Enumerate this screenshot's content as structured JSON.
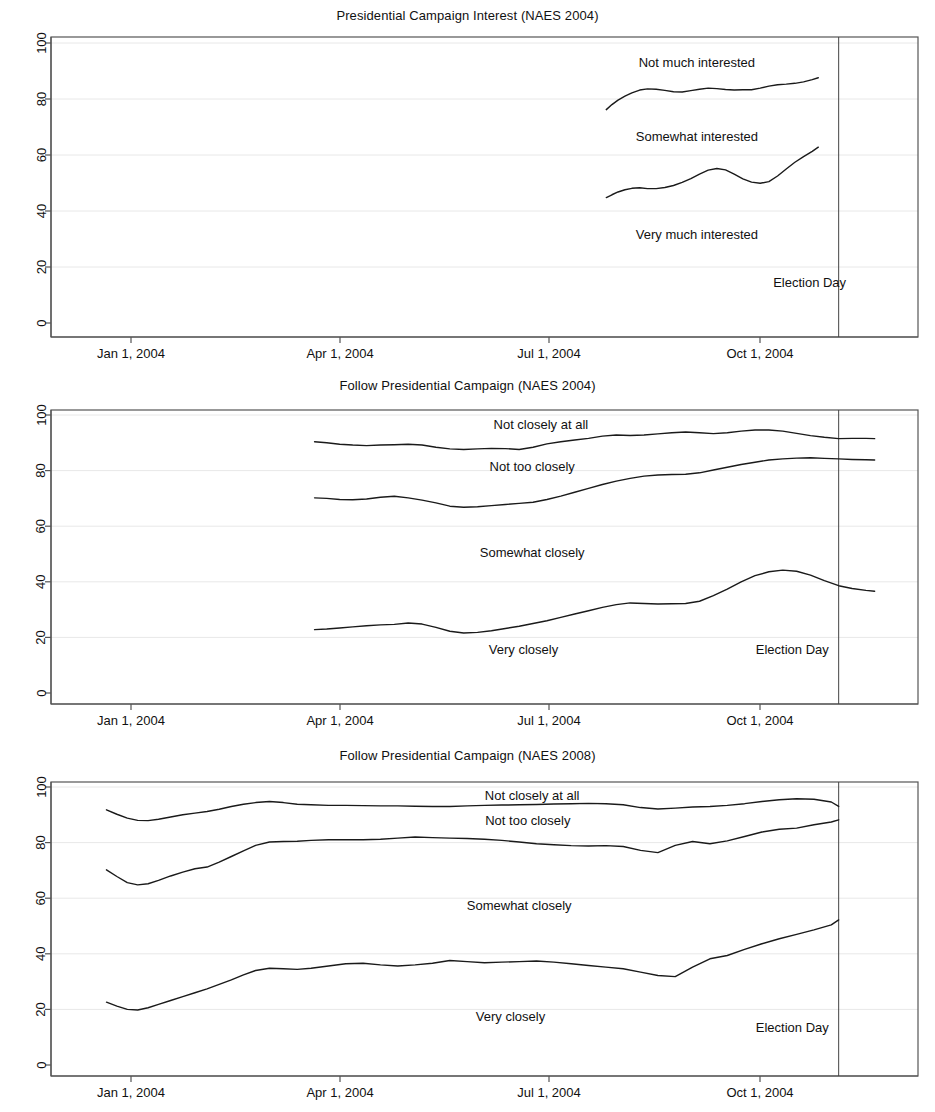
{
  "figure": {
    "background_color": "#ffffff",
    "line_color": "#1a1a1a",
    "grid_color": "#e8e8e8",
    "axis_color": "#555555"
  },
  "chart_data": [
    {
      "type": "line",
      "title": "Presidential Campaign Interest (NAES 2004)",
      "xlabel": "",
      "ylabel": "",
      "ylim": [
        0,
        100
      ],
      "yticks": [
        0,
        20,
        40,
        60,
        80,
        100
      ],
      "xlim": [
        "2003-11-20",
        "2004-11-20"
      ],
      "xticks": [
        "Jan 1, 2004",
        "Apr 1, 2004",
        "Jul 1, 2004",
        "Oct 1, 2004"
      ],
      "xtick_dates": [
        "2004-01-01",
        "2004-04-01",
        "2004-07-01",
        "2004-10-01"
      ],
      "grid": true,
      "legend_position": "inline-annotations",
      "annotations": [
        {
          "text": "Not much interested",
          "x_frac": 0.745,
          "y_value": 93
        },
        {
          "text": "Somewhat interested",
          "x_frac": 0.745,
          "y_value": 66.5
        },
        {
          "text": "Very much interested",
          "x_frac": 0.745,
          "y_value": 31.5
        },
        {
          "text": "Election Day",
          "x_frac": 0.875,
          "y_value": 14.5
        }
      ],
      "reference_line": {
        "label": "Election Day",
        "x_frac": 0.9085
      },
      "series": [
        {
          "name": "Cumulative: Not much interested (upper band)",
          "x_frac": [
            0.6405,
            0.647,
            0.654,
            0.662,
            0.67,
            0.679,
            0.688,
            0.698,
            0.708,
            0.718,
            0.728,
            0.738,
            0.748,
            0.758,
            0.768,
            0.778,
            0.788,
            0.798,
            0.808,
            0.818,
            0.828,
            0.838,
            0.848,
            0.858,
            0.868,
            0.878,
            0.885
          ],
          "values": [
            76.2,
            78.0,
            79.6,
            81.0,
            82.2,
            83.2,
            83.6,
            83.5,
            83.1,
            82.6,
            82.5,
            83.0,
            83.5,
            83.9,
            83.7,
            83.4,
            83.2,
            83.3,
            83.3,
            83.9,
            84.6,
            85.1,
            85.3,
            85.6,
            86.1,
            86.9,
            87.6
          ]
        },
        {
          "name": "Cumulative: Somewhat + Very interested (lower band)",
          "x_frac": [
            0.6405,
            0.647,
            0.654,
            0.662,
            0.67,
            0.679,
            0.688,
            0.698,
            0.708,
            0.718,
            0.728,
            0.738,
            0.748,
            0.758,
            0.768,
            0.778,
            0.788,
            0.798,
            0.808,
            0.818,
            0.828,
            0.838,
            0.848,
            0.858,
            0.868,
            0.878,
            0.885
          ],
          "values": [
            44.8,
            45.8,
            46.8,
            47.6,
            48.1,
            48.3,
            48.0,
            48.0,
            48.4,
            49.1,
            50.2,
            51.6,
            53.2,
            54.6,
            55.2,
            54.7,
            53.2,
            51.5,
            50.3,
            49.9,
            50.5,
            52.5,
            55.0,
            57.4,
            59.4,
            61.3,
            62.8
          ]
        }
      ]
    },
    {
      "type": "line",
      "title": "Follow Presidential Campaign (NAES 2004)",
      "xlabel": "",
      "ylabel": "",
      "ylim": [
        0,
        100
      ],
      "yticks": [
        0,
        20,
        40,
        60,
        80,
        100
      ],
      "xlim": [
        "2003-11-20",
        "2004-11-20"
      ],
      "xticks": [
        "Jan 1, 2004",
        "Apr 1, 2004",
        "Jul 1, 2004",
        "Oct 1, 2004"
      ],
      "xtick_dates": [
        "2004-01-01",
        "2004-04-01",
        "2004-07-01",
        "2004-10-01"
      ],
      "grid": true,
      "legend_position": "inline-annotations",
      "annotations": [
        {
          "text": "Not closely at all",
          "x_frac": 0.565,
          "y_value": 96.5
        },
        {
          "text": "Not too closely",
          "x_frac": 0.555,
          "y_value": 81.5
        },
        {
          "text": "Somewhat closely",
          "x_frac": 0.555,
          "y_value": 50.5
        },
        {
          "text": "Very closely",
          "x_frac": 0.545,
          "y_value": 15.5
        },
        {
          "text": "Election Day",
          "x_frac": 0.855,
          "y_value": 15.5
        }
      ],
      "reference_line": {
        "label": "Election Day",
        "x_frac": 0.9085
      },
      "series": [
        {
          "name": "Cumulative: Not closely at all (top band)",
          "x_frac": [
            0.304,
            0.318,
            0.333,
            0.348,
            0.364,
            0.38,
            0.396,
            0.412,
            0.428,
            0.444,
            0.46,
            0.476,
            0.492,
            0.508,
            0.524,
            0.54,
            0.556,
            0.572,
            0.588,
            0.604,
            0.62,
            0.636,
            0.652,
            0.668,
            0.684,
            0.7,
            0.716,
            0.732,
            0.748,
            0.764,
            0.78,
            0.796,
            0.812,
            0.828,
            0.844,
            0.86,
            0.876,
            0.892,
            0.9085,
            0.924,
            0.94,
            0.95
          ],
          "values": [
            90.4,
            90.0,
            89.5,
            89.2,
            89.0,
            89.2,
            89.3,
            89.5,
            89.2,
            88.4,
            87.8,
            87.6,
            87.8,
            88.0,
            87.9,
            87.6,
            88.4,
            89.6,
            90.4,
            91.0,
            91.6,
            92.4,
            92.8,
            92.6,
            92.8,
            93.2,
            93.6,
            93.9,
            93.6,
            93.3,
            93.6,
            94.2,
            94.6,
            94.6,
            94.2,
            93.4,
            92.6,
            92.0,
            91.5,
            91.6,
            91.6,
            91.5
          ]
        },
        {
          "name": "Cumulative: Not too closely (middle band)",
          "x_frac": [
            0.304,
            0.318,
            0.333,
            0.348,
            0.364,
            0.38,
            0.396,
            0.412,
            0.428,
            0.444,
            0.46,
            0.476,
            0.492,
            0.508,
            0.524,
            0.54,
            0.556,
            0.572,
            0.588,
            0.604,
            0.62,
            0.636,
            0.652,
            0.668,
            0.684,
            0.7,
            0.716,
            0.732,
            0.748,
            0.764,
            0.78,
            0.796,
            0.812,
            0.828,
            0.844,
            0.86,
            0.876,
            0.892,
            0.9085,
            0.924,
            0.94,
            0.95
          ],
          "values": [
            70.2,
            70.0,
            69.6,
            69.5,
            69.8,
            70.4,
            70.8,
            70.2,
            69.4,
            68.4,
            67.2,
            66.8,
            67.0,
            67.4,
            67.8,
            68.2,
            68.6,
            69.6,
            70.8,
            72.2,
            73.6,
            75.0,
            76.2,
            77.2,
            78.0,
            78.4,
            78.6,
            78.7,
            79.2,
            80.2,
            81.2,
            82.2,
            83.0,
            83.8,
            84.2,
            84.5,
            84.6,
            84.4,
            84.2,
            84.0,
            83.9,
            83.8
          ]
        },
        {
          "name": "Cumulative: Very closely (bottom band)",
          "x_frac": [
            0.304,
            0.318,
            0.333,
            0.348,
            0.364,
            0.38,
            0.396,
            0.412,
            0.428,
            0.444,
            0.46,
            0.476,
            0.492,
            0.508,
            0.524,
            0.54,
            0.556,
            0.572,
            0.588,
            0.604,
            0.62,
            0.636,
            0.652,
            0.668,
            0.684,
            0.7,
            0.716,
            0.732,
            0.748,
            0.764,
            0.78,
            0.796,
            0.812,
            0.828,
            0.844,
            0.86,
            0.876,
            0.892,
            0.9085,
            0.924,
            0.94,
            0.95
          ],
          "values": [
            22.8,
            23.0,
            23.4,
            23.8,
            24.2,
            24.5,
            24.7,
            25.2,
            24.8,
            23.6,
            22.2,
            21.6,
            21.8,
            22.4,
            23.2,
            24.0,
            25.0,
            26.0,
            27.2,
            28.4,
            29.6,
            30.8,
            31.8,
            32.4,
            32.2,
            32.0,
            32.1,
            32.2,
            33.0,
            35.0,
            37.4,
            40.0,
            42.2,
            43.6,
            44.2,
            43.8,
            42.4,
            40.4,
            38.6,
            37.6,
            36.9,
            36.6
          ]
        }
      ]
    },
    {
      "type": "line",
      "title": "Follow Presidential Campaign (NAES 2008)",
      "xlabel": "",
      "ylabel": "",
      "ylim": [
        0,
        100
      ],
      "yticks": [
        0,
        20,
        40,
        60,
        80,
        100
      ],
      "xlim": [
        "2003-11-20",
        "2004-11-20"
      ],
      "xticks": [
        "Jan 1, 2004",
        "Apr 1, 2004",
        "Jul 1, 2004",
        "Oct 1, 2004"
      ],
      "xtick_dates": [
        "2004-01-01",
        "2004-04-01",
        "2004-07-01",
        "2004-10-01"
      ],
      "grid": true,
      "legend_position": "inline-annotations",
      "annotations": [
        {
          "text": "Not closely at all",
          "x_frac": 0.555,
          "y_value": 97.0
        },
        {
          "text": "Not too closely",
          "x_frac": 0.55,
          "y_value": 88.0
        },
        {
          "text": "Somewhat closely",
          "x_frac": 0.54,
          "y_value": 57.5
        },
        {
          "text": "Very closely",
          "x_frac": 0.53,
          "y_value": 17.5
        },
        {
          "text": "Election Day",
          "x_frac": 0.855,
          "y_value": 13.5
        }
      ],
      "reference_line": {
        "label": "Election Day",
        "x_frac": 0.9085
      },
      "series": [
        {
          "name": "Cumulative: Not closely at all (top band)",
          "x_frac": [
            0.064,
            0.076,
            0.088,
            0.1,
            0.112,
            0.124,
            0.138,
            0.152,
            0.166,
            0.18,
            0.194,
            0.208,
            0.222,
            0.236,
            0.252,
            0.268,
            0.284,
            0.3,
            0.32,
            0.34,
            0.36,
            0.38,
            0.4,
            0.42,
            0.44,
            0.46,
            0.48,
            0.5,
            0.52,
            0.54,
            0.56,
            0.58,
            0.6,
            0.62,
            0.64,
            0.66,
            0.68,
            0.7,
            0.72,
            0.74,
            0.76,
            0.78,
            0.8,
            0.82,
            0.84,
            0.86,
            0.88,
            0.9,
            0.9085
          ],
          "values": [
            91.8,
            90.2,
            88.8,
            88.0,
            87.9,
            88.4,
            89.2,
            90.0,
            90.6,
            91.2,
            92.0,
            93.0,
            93.8,
            94.4,
            94.8,
            94.4,
            93.8,
            93.6,
            93.4,
            93.4,
            93.3,
            93.2,
            93.2,
            93.1,
            93.0,
            93.0,
            93.2,
            93.4,
            93.5,
            93.6,
            93.7,
            93.9,
            94.0,
            94.1,
            94.0,
            93.6,
            92.6,
            92.1,
            92.4,
            92.8,
            93.0,
            93.4,
            94.0,
            94.8,
            95.4,
            95.8,
            95.6,
            94.6,
            93.0
          ]
        },
        {
          "name": "Cumulative: Not too closely (middle band)",
          "x_frac": [
            0.064,
            0.076,
            0.088,
            0.1,
            0.112,
            0.124,
            0.138,
            0.152,
            0.166,
            0.18,
            0.194,
            0.208,
            0.222,
            0.236,
            0.252,
            0.268,
            0.284,
            0.3,
            0.32,
            0.34,
            0.36,
            0.38,
            0.4,
            0.42,
            0.44,
            0.46,
            0.48,
            0.5,
            0.52,
            0.54,
            0.56,
            0.58,
            0.6,
            0.62,
            0.64,
            0.66,
            0.68,
            0.7,
            0.72,
            0.74,
            0.76,
            0.78,
            0.8,
            0.82,
            0.84,
            0.86,
            0.88,
            0.9,
            0.9085
          ],
          "values": [
            70.2,
            67.8,
            65.6,
            64.8,
            65.2,
            66.4,
            68.0,
            69.4,
            70.6,
            71.2,
            73.0,
            75.0,
            77.0,
            79.0,
            80.2,
            80.4,
            80.5,
            80.8,
            81.0,
            81.0,
            81.0,
            81.2,
            81.6,
            82.0,
            81.8,
            81.6,
            81.5,
            81.2,
            80.8,
            80.2,
            79.6,
            79.2,
            78.9,
            78.8,
            78.9,
            78.6,
            77.2,
            76.4,
            79.0,
            80.4,
            79.6,
            80.6,
            82.2,
            83.8,
            84.8,
            85.2,
            86.4,
            87.4,
            88.2
          ]
        },
        {
          "name": "Cumulative: Very closely (bottom band)",
          "x_frac": [
            0.064,
            0.076,
            0.088,
            0.1,
            0.112,
            0.124,
            0.138,
            0.152,
            0.166,
            0.18,
            0.194,
            0.208,
            0.222,
            0.236,
            0.252,
            0.268,
            0.284,
            0.3,
            0.32,
            0.34,
            0.36,
            0.38,
            0.4,
            0.42,
            0.44,
            0.46,
            0.48,
            0.5,
            0.52,
            0.54,
            0.56,
            0.58,
            0.6,
            0.62,
            0.64,
            0.66,
            0.68,
            0.7,
            0.72,
            0.74,
            0.76,
            0.78,
            0.8,
            0.82,
            0.84,
            0.86,
            0.88,
            0.9,
            0.9085
          ],
          "values": [
            22.6,
            21.2,
            20.0,
            19.8,
            20.6,
            21.8,
            23.2,
            24.6,
            26.0,
            27.4,
            29.0,
            30.6,
            32.4,
            34.0,
            34.8,
            34.6,
            34.4,
            34.8,
            35.6,
            36.4,
            36.6,
            36.0,
            35.6,
            36.0,
            36.6,
            37.6,
            37.2,
            36.8,
            37.0,
            37.2,
            37.4,
            37.0,
            36.4,
            35.8,
            35.2,
            34.6,
            33.4,
            32.2,
            31.8,
            35.2,
            38.2,
            39.4,
            41.6,
            43.6,
            45.4,
            47.0,
            48.6,
            50.4,
            52.2
          ]
        }
      ]
    }
  ]
}
